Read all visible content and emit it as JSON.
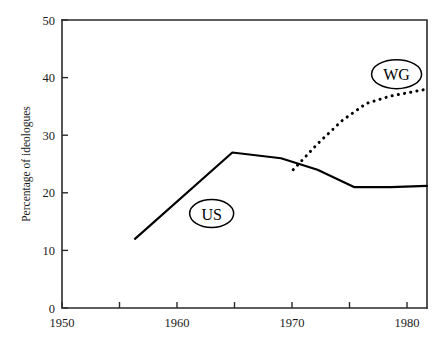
{
  "chart_data": {
    "type": "line",
    "title": "",
    "xlabel": "",
    "ylabel": "Percentage of ideologues",
    "xlim": [
      1950,
      1980
    ],
    "ylim": [
      0,
      50
    ],
    "grid": false,
    "legend_position": "inline-callout-labels",
    "x_ticks": [
      {
        "value": 1950,
        "label": "1950",
        "major": true
      },
      {
        "value": 1955,
        "label": "",
        "major": false
      },
      {
        "value": 1960,
        "label": "1960",
        "major": true
      },
      {
        "value": 1965,
        "label": "",
        "major": false
      },
      {
        "value": 1970,
        "label": "1970",
        "major": true
      },
      {
        "value": 1975,
        "label": "",
        "major": false
      },
      {
        "value": 1980,
        "label": "1980",
        "major": true
      }
    ],
    "y_ticks": [
      {
        "value": 0,
        "label": "0"
      },
      {
        "value": 10,
        "label": "10"
      },
      {
        "value": 20,
        "label": "20"
      },
      {
        "value": 30,
        "label": "30"
      },
      {
        "value": 40,
        "label": "40"
      },
      {
        "value": 50,
        "label": "50"
      }
    ],
    "series": [
      {
        "name": "US",
        "style": "solid",
        "color": "#000000",
        "x": [
          1956,
          1964,
          1968,
          1971,
          1974,
          1977,
          1980
        ],
        "values": [
          12,
          27,
          26,
          24,
          21,
          21,
          21.2
        ]
      },
      {
        "name": "WG",
        "style": "dotted",
        "color": "#000000",
        "x": [
          1969,
          1971,
          1973,
          1975,
          1977,
          1980
        ],
        "values": [
          24,
          28.5,
          32.5,
          35.5,
          36.8,
          38
        ]
      }
    ],
    "annotations": [
      {
        "text": "US",
        "shape": "ellipse",
        "x": 1962.3,
        "y": 16.4
      },
      {
        "text": "WG",
        "shape": "ellipse",
        "x": 1977.5,
        "y": 40.6
      }
    ]
  }
}
